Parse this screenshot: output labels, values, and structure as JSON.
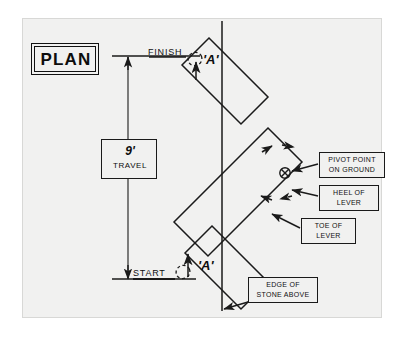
{
  "drawing": {
    "title": "PLAN",
    "paper_color": "#f1f1f0",
    "ink_color": "#1a1a1a",
    "medium": "hand-drawn engineering plan view",
    "dimension": {
      "value": "9'",
      "label": "TRAVEL",
      "top_tick_label": "FINISH",
      "bottom_tick_label": "START"
    },
    "section_markers": [
      {
        "id": "marker-a-finish",
        "label": "'A'",
        "position": "finish"
      },
      {
        "id": "marker-a-start",
        "label": "'A'",
        "position": "start"
      }
    ],
    "callouts": [
      {
        "id": "pivot-point",
        "line1": "PIVOT POINT",
        "line2": "ON GROUND"
      },
      {
        "id": "heel-of-lever",
        "line1": "HEEL OF",
        "line2": "LEVER"
      },
      {
        "id": "toe-of-lever",
        "line1": "TOE OF",
        "line2": "LEVER"
      },
      {
        "id": "edge-of-stone",
        "line1": "EDGE OF",
        "line2": "STONE ABOVE"
      }
    ]
  }
}
